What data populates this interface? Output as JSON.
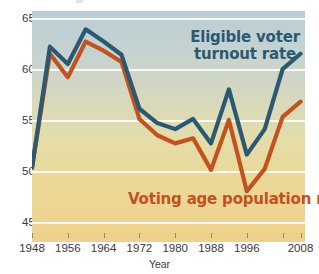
{
  "chart_data": {
    "type": "line",
    "title": "",
    "xlabel": "Year",
    "ylabel": "",
    "xlim": [
      1948,
      2009
    ],
    "ylim": [
      44,
      65.8
    ],
    "grid": true,
    "gridlines_y": [
      45,
      50,
      55,
      60,
      65
    ],
    "y_ticklabels": [
      "45",
      "50",
      "55",
      "60",
      "65"
    ],
    "x_ticklabels": [
      "1948",
      "1956",
      "1964",
      "1972",
      "1980",
      "1988",
      "1996",
      "2008"
    ],
    "x_tickvalues": [
      1948,
      1956,
      1964,
      1972,
      1980,
      1988,
      1996,
      2008
    ],
    "x_minor_tickvalues": [
      2004,
      2008
    ],
    "legend_position": "inline-annotations",
    "x": [
      1948,
      1952,
      1956,
      1960,
      1964,
      1968,
      1972,
      1976,
      1980,
      1984,
      1988,
      1992,
      1996,
      2000,
      2004,
      2008
    ],
    "series": [
      {
        "name": "Eligible voter turnout rate",
        "color": "#2c5871",
        "values": [
          50.4,
          62.3,
          60.6,
          64.0,
          62.8,
          61.5,
          56.2,
          54.8,
          54.2,
          55.2,
          52.8,
          58.1,
          51.7,
          54.2,
          60.1,
          61.6
        ]
      },
      {
        "name": "Voting age population rate*",
        "color": "#c2521f",
        "values": [
          50.4,
          61.6,
          59.3,
          62.8,
          61.9,
          60.8,
          55.2,
          53.6,
          52.8,
          53.3,
          50.2,
          55.1,
          48.1,
          50.3,
          55.4,
          56.9
        ]
      }
    ],
    "annotations": [
      {
        "text": "Eligible voter turnout rate",
        "color": "#2c5871"
      },
      {
        "text": "Voting age population rate*",
        "color": "#c2521f"
      }
    ]
  },
  "axis": {
    "x_title": "Year",
    "y_labels": [
      "65",
      "60",
      "55",
      "50",
      "45"
    ],
    "x_labels": [
      "1948",
      "1956",
      "1964",
      "1972",
      "1980",
      "1988",
      "1996",
      "2008"
    ]
  },
  "labels": {
    "blue_line1": "Eligible voter",
    "blue_line2": "turnout rate",
    "orange": "Voting age population rate*"
  }
}
